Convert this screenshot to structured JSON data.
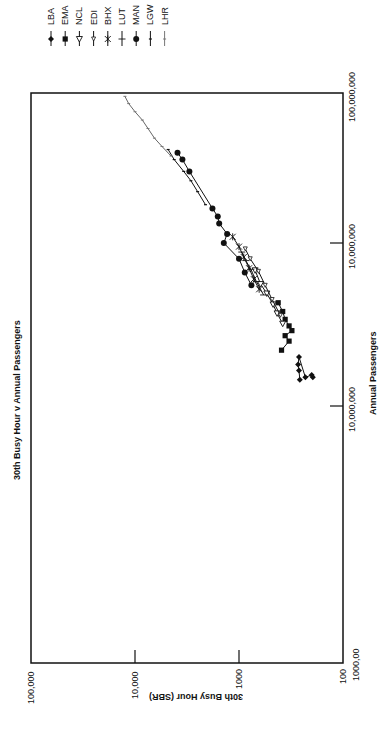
{
  "chart_data": {
    "type": "line",
    "orientation": "rotated-90-ccw",
    "title": "30th Busy Hour v Annual Passengers",
    "xlabel": "Annual Passengers",
    "ylabel": "30th Busy Hour (SBR)",
    "xscale": "log",
    "yscale": "log",
    "xlim": [
      100000,
      100000000
    ],
    "ylim": [
      100,
      100000
    ],
    "x_ticks": [
      {
        "value": 100000,
        "label": "1000,00"
      },
      {
        "value": 1000000,
        "label": "10,000,000"
      },
      {
        "value": 10000000,
        "label": "10,000,000"
      },
      {
        "value": 100000000,
        "label": "100,000,000"
      }
    ],
    "y_ticks": [
      {
        "value": 100,
        "label": "100"
      },
      {
        "value": 1000,
        "label": "1000"
      },
      {
        "value": 10000,
        "label": "10,000"
      },
      {
        "value": 100000,
        "label": "100,000"
      }
    ],
    "grid": false,
    "legend_position": "top-right (rotated)",
    "series": [
      {
        "name": "LBA",
        "marker": "diamond",
        "points": [
          [
            1450000,
            260
          ],
          [
            1650000,
            265
          ],
          [
            1800000,
            270
          ],
          [
            2000000,
            265
          ],
          [
            1500000,
            230
          ],
          [
            1550000,
            200
          ],
          [
            1500000,
            195
          ]
        ]
      },
      {
        "name": "EMA",
        "marker": "square",
        "points": [
          [
            2200000,
            390
          ],
          [
            2500000,
            330
          ],
          [
            2700000,
            360
          ],
          [
            2900000,
            310
          ],
          [
            3100000,
            330
          ],
          [
            3400000,
            360
          ],
          [
            3800000,
            380
          ],
          [
            4300000,
            420
          ]
        ]
      },
      {
        "name": "NCL",
        "marker": "triangle-open",
        "points": [
          [
            3200000,
            380
          ],
          [
            3700000,
            430
          ],
          [
            4200000,
            470
          ],
          [
            4900000,
            540
          ],
          [
            5600000,
            620
          ],
          [
            6800000,
            700
          ]
        ]
      },
      {
        "name": "EDI",
        "marker": "triangle-open-small",
        "points": [
          [
            3600000,
            400
          ],
          [
            4500000,
            480
          ],
          [
            5500000,
            560
          ],
          [
            6700000,
            650
          ],
          [
            8000000,
            780
          ],
          [
            9200000,
            870
          ]
        ]
      },
      {
        "name": "BHX",
        "marker": "star",
        "points": [
          [
            5200000,
            640
          ],
          [
            6000000,
            720
          ],
          [
            7000000,
            800
          ],
          [
            8200000,
            900
          ],
          [
            9500000,
            1000
          ],
          [
            11000000,
            1150
          ]
        ]
      },
      {
        "name": "LUT",
        "marker": "cross",
        "points": [
          [
            4800000,
            580
          ],
          [
            5800000,
            680
          ],
          [
            6900000,
            770
          ],
          [
            7800000,
            860
          ],
          [
            8800000,
            940
          ]
        ]
      },
      {
        "name": "MAN",
        "marker": "circle",
        "points": [
          [
            5500000,
            760
          ],
          [
            6600000,
            880
          ],
          [
            8000000,
            1000
          ],
          [
            10000000,
            1400
          ],
          [
            11500000,
            1300
          ],
          [
            13500000,
            1550
          ],
          [
            15000000,
            1600
          ],
          [
            17000000,
            1800
          ],
          [
            30000000,
            3000
          ],
          [
            36000000,
            3500
          ],
          [
            40000000,
            3900
          ]
        ]
      },
      {
        "name": "LGW",
        "marker": "tick",
        "points": [
          [
            18000000,
            2100
          ],
          [
            22000000,
            2500
          ],
          [
            26000000,
            2900
          ],
          [
            30000000,
            3400
          ],
          [
            36000000,
            4200
          ],
          [
            42000000,
            4800
          ]
        ]
      },
      {
        "name": "LHR",
        "marker": "tick-light",
        "points": [
          [
            38000000,
            4500
          ],
          [
            44000000,
            5500
          ],
          [
            50000000,
            6500
          ],
          [
            58000000,
            7500
          ],
          [
            66000000,
            8500
          ],
          [
            75000000,
            10000
          ],
          [
            85000000,
            11500
          ],
          [
            95000000,
            12500
          ]
        ]
      }
    ]
  },
  "legend": {
    "items": [
      {
        "label": "LBA",
        "marker": "diamond"
      },
      {
        "label": "EMA",
        "marker": "square"
      },
      {
        "label": "NCL",
        "marker": "triangle-open"
      },
      {
        "label": "EDI",
        "marker": "triangle-open-small"
      },
      {
        "label": "BHX",
        "marker": "star"
      },
      {
        "label": "LUT",
        "marker": "cross"
      },
      {
        "label": "MAN",
        "marker": "circle"
      },
      {
        "label": "LGW",
        "marker": "tick"
      },
      {
        "label": "LHR",
        "marker": "tick-light"
      }
    ]
  }
}
